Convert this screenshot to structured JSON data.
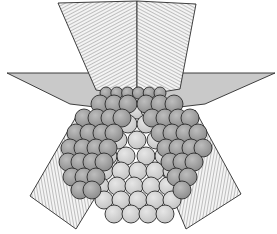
{
  "figure": {
    "width": 277,
    "height": 234,
    "colors": {
      "background": "#ffffff",
      "outline": "#2b2b2b",
      "hatch_line": "#6e6e6e",
      "hatch_bg": "#f4f4f4",
      "horizontal_plane": "#c9c9c9",
      "sphere_dark": "#9a9a9a",
      "sphere_mid": "#b5b5b5",
      "sphere_light": "#d6d6d6"
    },
    "planes": {
      "top_left": [
        [
          58,
          3
        ],
        [
          137,
          1
        ],
        [
          137,
          96
        ],
        [
          96,
          90
        ]
      ],
      "top_right": [
        [
          137,
          1
        ],
        [
          196,
          4
        ],
        [
          180,
          89
        ],
        [
          137,
          96
        ]
      ],
      "horizontal": [
        [
          7,
          73
        ],
        [
          275,
          73
        ],
        [
          205,
          104
        ],
        [
          137,
          112
        ],
        [
          70,
          104
        ]
      ],
      "lower_left": [
        [
          80,
          110
        ],
        [
          118,
          160
        ],
        [
          76,
          229
        ],
        [
          30,
          196
        ]
      ],
      "lower_right": [
        [
          195,
          110
        ],
        [
          241,
          194
        ],
        [
          186,
          229
        ],
        [
          157,
          160
        ]
      ]
    },
    "spheres": {
      "radius": 9,
      "top_small_row": {
        "y": 93,
        "x_start": 106,
        "x_end": 170,
        "r": 6
      },
      "layers_left": [
        {
          "y": 104,
          "x": [
            100,
            114,
            128
          ]
        },
        {
          "y": 118,
          "x": [
            84,
            97,
            110,
            122
          ]
        },
        {
          "y": 133,
          "x": [
            76,
            89,
            102,
            114
          ]
        },
        {
          "y": 148,
          "x": [
            70,
            83,
            96,
            108
          ]
        },
        {
          "y": 162,
          "x": [
            68,
            80,
            92,
            104
          ]
        },
        {
          "y": 177,
          "x": [
            72,
            84,
            96
          ]
        },
        {
          "y": 190,
          "x": [
            80,
            92
          ]
        }
      ],
      "layers_right": [
        {
          "y": 104,
          "x": [
            146,
            160,
            174
          ]
        },
        {
          "y": 118,
          "x": [
            152,
            165,
            178,
            190
          ]
        },
        {
          "y": 133,
          "x": [
            160,
            172,
            185,
            198
          ]
        },
        {
          "y": 148,
          "x": [
            166,
            178,
            191,
            203
          ]
        },
        {
          "y": 162,
          "x": [
            170,
            182,
            194
          ]
        },
        {
          "y": 177,
          "x": [
            176,
            188
          ]
        },
        {
          "y": 190,
          "x": [
            182
          ]
        }
      ],
      "layers_center": [
        {
          "y": 110,
          "x": [
            124,
            137,
            150
          ]
        },
        {
          "y": 124,
          "x": [
            128,
            146
          ]
        },
        {
          "y": 140,
          "x": [
            118,
            137,
            156
          ]
        },
        {
          "y": 156,
          "x": [
            108,
            126,
            146,
            164
          ]
        },
        {
          "y": 171,
          "x": [
            104,
            121,
            138,
            155,
            172
          ]
        },
        {
          "y": 186,
          "x": [
            100,
            117,
            134,
            151,
            168
          ]
        },
        {
          "y": 200,
          "x": [
            104,
            121,
            138,
            155,
            172
          ]
        },
        {
          "y": 214,
          "x": [
            114,
            131,
            148,
            165
          ]
        }
      ]
    },
    "caption": ""
  }
}
